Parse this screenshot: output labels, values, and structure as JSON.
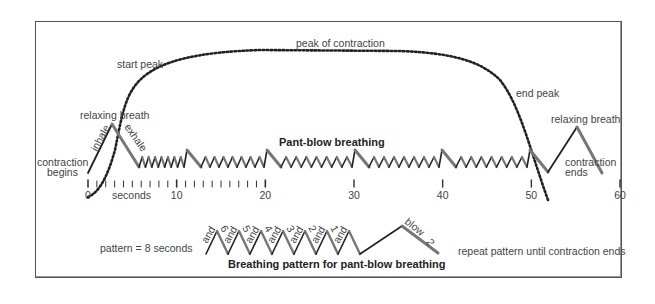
{
  "diagram": {
    "curve_labels": {
      "peak": "peak of contraction",
      "start_peak": "start peak",
      "end_peak": "end peak",
      "relaxing_breath_start": "relaxing breath",
      "relaxing_breath_end": "relaxing breath",
      "inhale": "inhale",
      "exhale": "exhale",
      "contraction_begins_1": "contraction",
      "contraction_begins_2": "begins",
      "contraction_ends_1": "contraction",
      "contraction_ends_2": "ends",
      "pant_blow_title": "Pant-blow breathing"
    },
    "axis": {
      "unit_label": "seconds",
      "min": 0,
      "max": 60,
      "major_ticks": [
        "0",
        "10",
        "20",
        "30",
        "40",
        "50",
        "60"
      ]
    },
    "pattern": {
      "duration_label": "pattern = 8 seconds",
      "title": "Breathing pattern for pant-blow breathing",
      "repeat_note": "repeat pattern until contraction ends",
      "counts": [
        "and",
        "6",
        "and",
        "5",
        "and",
        "4",
        "and",
        "3",
        "and",
        "2",
        "and",
        "1",
        "and",
        "blow",
        "2"
      ]
    },
    "colors": {
      "line": "#222222",
      "exhale_gray": "#777777",
      "text": "#444444",
      "frame": "#555555"
    }
  }
}
